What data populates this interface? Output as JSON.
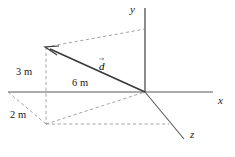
{
  "figure": {
    "background_color": "#ffffff",
    "line_color": "#4d4d4d",
    "dash_color": "#8c8c8c",
    "text_color": "#1a1a1a",
    "width": 235,
    "height": 157
  },
  "axes": [
    {
      "name": "x",
      "label": "x",
      "label_x": 218,
      "label_y": 95
    },
    {
      "name": "y",
      "label": "y",
      "label_x": 130,
      "label_y": 5
    },
    {
      "name": "z",
      "label": "z",
      "label_x": 190,
      "label_y": 130
    }
  ],
  "vector": {
    "symbol": "d",
    "label": "d",
    "has_overarrow": true,
    "label_x": 99,
    "label_y": 52,
    "tail_x": 145,
    "tail_y": 92,
    "head_x": 46,
    "head_y": 47
  },
  "measurements": [
    {
      "name": "vertical-3m",
      "label": "3 m",
      "x": 16,
      "y": 67
    },
    {
      "name": "horizontal-6m",
      "label": "6 m",
      "x": 72,
      "y": 78
    },
    {
      "name": "depth-2m",
      "label": "2 m",
      "x": 10,
      "y": 110
    }
  ],
  "geometry": {
    "origin": {
      "x": 145,
      "y": 92
    },
    "corner_top": {
      "x": 46,
      "y": 47
    },
    "corner_bottom": {
      "x": 46,
      "y": 124
    },
    "x_axis_start": {
      "x": 8,
      "y": 92
    },
    "x_axis_end": {
      "x": 213,
      "y": 92
    },
    "y_axis_top": {
      "x": 145,
      "y": 8
    },
    "z_axis_end": {
      "x": 184,
      "y": 139
    }
  }
}
